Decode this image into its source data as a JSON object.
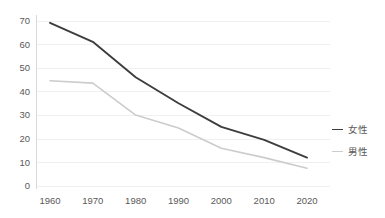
{
  "chart_data": {
    "type": "line",
    "title": "",
    "subtitle": "",
    "xlabel": "",
    "ylabel": "",
    "x": [
      "1960",
      "1970",
      "1980",
      "1990",
      "2000",
      "2010",
      "2020"
    ],
    "categories": [
      "1960",
      "1970",
      "1980",
      "1990",
      "2000",
      "2010",
      "2020"
    ],
    "series": [
      {
        "name": "女性",
        "color": "#3d3d3d",
        "values": [
          69,
          61,
          46,
          35,
          25,
          19.5,
          12
        ]
      },
      {
        "name": "男性",
        "color": "#cccccc",
        "values": [
          44.5,
          43.5,
          30,
          24.5,
          16,
          12,
          7.5
        ]
      }
    ],
    "ylim": [
      0,
      70
    ],
    "xlim": [
      "1960",
      "2020"
    ],
    "y_ticks": [
      "0",
      "10",
      "20",
      "30",
      "40",
      "50",
      "60",
      "70"
    ],
    "y_tick_values": [
      0,
      10,
      20,
      30,
      40,
      50,
      60,
      70
    ],
    "x_ticks": [
      "1960",
      "1970",
      "1980",
      "1990",
      "2000",
      "2010",
      "2020"
    ],
    "grid": "horizontal",
    "grid_color": "#f0f0f0",
    "axis_color": "#d9d9d9",
    "background_color": "#ffffff",
    "legend_position": "right",
    "legend": [
      {
        "label": "女性",
        "color": "#3d3d3d",
        "marker": "line-dash"
      },
      {
        "label": "男性",
        "color": "#cccccc",
        "marker": "line-dash"
      }
    ]
  }
}
